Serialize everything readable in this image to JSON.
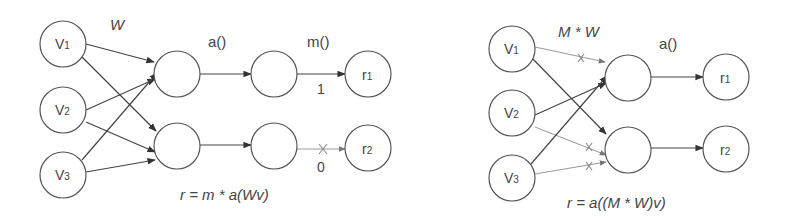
{
  "left_panel": {
    "weight_label": "W",
    "activation_label": "a()",
    "mask_label": "m()",
    "inputs": [
      {
        "main": "V",
        "sub": "1"
      },
      {
        "main": "V",
        "sub": "2"
      },
      {
        "main": "V",
        "sub": "3"
      }
    ],
    "outputs": [
      {
        "main": "r",
        "sub": "1"
      },
      {
        "main": "r",
        "sub": "2"
      }
    ],
    "mask_values": [
      "1",
      "0"
    ],
    "formula": "r = m * a(Wv)"
  },
  "right_panel": {
    "weight_label": "M * W",
    "activation_label": "a()",
    "inputs": [
      {
        "main": "V",
        "sub": "1"
      },
      {
        "main": "V",
        "sub": "2"
      },
      {
        "main": "V",
        "sub": "3"
      }
    ],
    "outputs": [
      {
        "main": "r",
        "sub": "1"
      },
      {
        "main": "r",
        "sub": "2"
      }
    ],
    "formula": "r =  a((M * W)v)"
  },
  "colors": {
    "stroke": "#555555",
    "masked_edge": "#999999",
    "text": "#444444"
  }
}
